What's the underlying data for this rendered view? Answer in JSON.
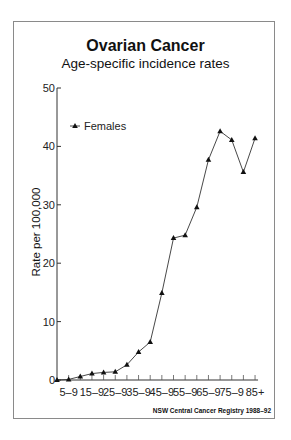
{
  "chart": {
    "title": "Ovarian Cancer",
    "subtitle": "Age-specific incidence rates",
    "ylabel": "Rate per 100,000",
    "source": "NSW Central Cancer Registry 1988–92",
    "legend_label": "Females"
  },
  "chart_data": {
    "type": "line",
    "title": "Ovarian Cancer",
    "subtitle": "Age-specific incidence rates",
    "xlabel": "",
    "ylabel": "Rate per 100,000",
    "ylim": [
      0,
      50
    ],
    "yticks": [
      0,
      10,
      20,
      30,
      40,
      50
    ],
    "grid": false,
    "legend_position": "upper-left",
    "categories": [
      "0–4",
      "5–9",
      "10–14",
      "15–19",
      "20–24",
      "25–29",
      "30–34",
      "35–39",
      "40–44",
      "45–49",
      "50–54",
      "55–59",
      "60–64",
      "65–69",
      "70–74",
      "75–79",
      "80–84",
      "85+"
    ],
    "x_tick_labels": [
      "5–9",
      "15–9",
      "25–9",
      "35–9",
      "45–9",
      "55–9",
      "65–9",
      "75–9",
      "85+"
    ],
    "series": [
      {
        "name": "Females",
        "marker": "triangle",
        "values": [
          0.0,
          0.1,
          0.6,
          1.1,
          1.3,
          1.4,
          2.6,
          4.8,
          6.5,
          14.9,
          24.3,
          24.8,
          29.6,
          37.7,
          42.6,
          41.1,
          35.6,
          41.4
        ]
      }
    ],
    "annotations": [
      "NSW Central Cancer Registry 1988–92"
    ]
  }
}
